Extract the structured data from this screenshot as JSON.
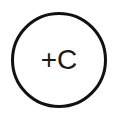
{
  "diagram": {
    "node": {
      "shape": "circle",
      "label": "+C",
      "stroke_color": "#111111",
      "fill_color": "#ffffff"
    }
  }
}
